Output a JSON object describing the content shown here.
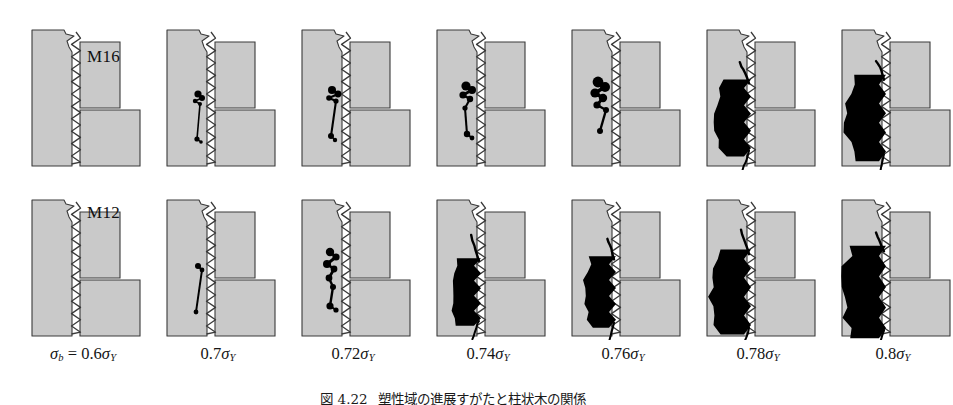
{
  "figure": {
    "caption_label": "図 4.22",
    "caption_text": "塑性域の進展すがたと柱状木の関係",
    "background_color": "#ffffff",
    "material_fill_color": "#c9c9c9",
    "outline_color": "#3a3a3a",
    "damage_color": "#000000"
  },
  "rows": [
    {
      "id": "m16",
      "label": "M16",
      "description": "Bolt-nut thread engagement cross-section, M16 size"
    },
    {
      "id": "m12",
      "label": "M12",
      "description": "Bolt-nut thread engagement cross-section, M12 size"
    }
  ],
  "stress_axis": {
    "symbol": "σ",
    "subscript_applied": "b",
    "subscript_yield": "Y",
    "labels": [
      {
        "prefix": "σ",
        "prefix_sub": "b",
        "equals": " = ",
        "value": "0.6",
        "unit_sym": "σ",
        "unit_sub": "Y"
      },
      {
        "prefix": "",
        "prefix_sub": "",
        "equals": "",
        "value": "0.7",
        "unit_sym": "σ",
        "unit_sub": "Y"
      },
      {
        "prefix": "",
        "prefix_sub": "",
        "equals": "",
        "value": "0.72",
        "unit_sym": "σ",
        "unit_sub": "Y"
      },
      {
        "prefix": "",
        "prefix_sub": "",
        "equals": "",
        "value": "0.74",
        "unit_sym": "σ",
        "unit_sub": "Y"
      },
      {
        "prefix": "",
        "prefix_sub": "",
        "equals": "",
        "value": "0.76",
        "unit_sym": "σ",
        "unit_sub": "Y"
      },
      {
        "prefix": "",
        "prefix_sub": "",
        "equals": "",
        "value": "0.78",
        "unit_sym": "σ",
        "unit_sub": "Y"
      },
      {
        "prefix": "",
        "prefix_sub": "",
        "equals": "",
        "value": "0.8",
        "unit_sym": "σ",
        "unit_sub": "Y"
      }
    ],
    "full_text": [
      "σb = 0.6σY",
      "0.7σY",
      "0.72σY",
      "0.74σY",
      "0.76σY",
      "0.78σY",
      "0.8σY"
    ]
  },
  "chart_data": {
    "type": "heatmap",
    "title": "塑性域の進展すがたと柱状木の関係",
    "xlabel": "σb",
    "ylabel": "bolt size",
    "categories": [
      "0.6σY",
      "0.7σY",
      "0.72σY",
      "0.74σY",
      "0.76σY",
      "0.78σY",
      "0.8σY"
    ],
    "series": [
      {
        "name": "M16",
        "values": [
          0,
          0.08,
          0.14,
          0.2,
          0.32,
          0.72,
          0.82
        ]
      },
      {
        "name": "M12",
        "values": [
          0,
          0.05,
          0.22,
          0.55,
          0.6,
          0.8,
          0.88
        ]
      }
    ],
    "value_meaning": "normalized extent of black plastic (damage) zone spreading from the thread root into the bolt shank",
    "grid": false,
    "legend": "none"
  },
  "panels": [
    {
      "row": "m16",
      "col": 0,
      "stress": "0.6σY",
      "damage": "none",
      "blobs": []
    },
    {
      "row": "m16",
      "col": 1,
      "stress": "0.7σY",
      "damage": "initiation",
      "blobs": [
        {
          "cx": 39,
          "cy": 76,
          "r": 3.6
        },
        {
          "cx": 43,
          "cy": 80,
          "r": 3.0
        },
        {
          "cx": 36,
          "cy": 83,
          "r": 2.2
        },
        {
          "cx": 41,
          "cy": 86,
          "r": 2.0
        },
        {
          "cx": 38,
          "cy": 121,
          "r": 2.6
        },
        {
          "cx": 42,
          "cy": 124,
          "r": 1.8
        }
      ]
    },
    {
      "row": "m16",
      "col": 2,
      "stress": "0.72σY",
      "damage": "initiation",
      "blobs": [
        {
          "cx": 38,
          "cy": 72,
          "r": 4.0
        },
        {
          "cx": 44,
          "cy": 76,
          "r": 3.4
        },
        {
          "cx": 35,
          "cy": 80,
          "r": 2.8
        },
        {
          "cx": 42,
          "cy": 83,
          "r": 2.6
        },
        {
          "cx": 37,
          "cy": 118,
          "r": 3.0
        },
        {
          "cx": 41,
          "cy": 122,
          "r": 2.2
        }
      ]
    },
    {
      "row": "m16",
      "col": 3,
      "stress": "0.74σY",
      "damage": "growing",
      "blobs": [
        {
          "cx": 37,
          "cy": 68,
          "r": 4.6
        },
        {
          "cx": 43,
          "cy": 72,
          "r": 4.0
        },
        {
          "cx": 34,
          "cy": 77,
          "r": 3.6
        },
        {
          "cx": 41,
          "cy": 81,
          "r": 3.2
        },
        {
          "cx": 36,
          "cy": 90,
          "r": 2.6
        },
        {
          "cx": 38,
          "cy": 116,
          "r": 3.2
        },
        {
          "cx": 43,
          "cy": 120,
          "r": 2.4
        }
      ]
    },
    {
      "row": "m16",
      "col": 4,
      "stress": "0.76σY",
      "damage": "coalescing",
      "blobs": [
        {
          "cx": 34,
          "cy": 64,
          "r": 5.4
        },
        {
          "cx": 41,
          "cy": 69,
          "r": 5.0
        },
        {
          "cx": 31,
          "cy": 75,
          "r": 4.6
        },
        {
          "cx": 39,
          "cy": 80,
          "r": 4.2
        },
        {
          "cx": 33,
          "cy": 87,
          "r": 3.6
        },
        {
          "cx": 42,
          "cy": 92,
          "r": 3.0
        },
        {
          "cx": 36,
          "cy": 113,
          "r": 3.0
        }
      ]
    },
    {
      "row": "m16",
      "col": 5,
      "stress": "0.78σY",
      "damage": "large-zone",
      "blobs": []
    },
    {
      "row": "m16",
      "col": 6,
      "stress": "0.8σY",
      "damage": "large-zone",
      "blobs": []
    },
    {
      "row": "m12",
      "col": 0,
      "stress": "0.6σY",
      "damage": "none",
      "blobs": []
    },
    {
      "row": "m12",
      "col": 1,
      "stress": "0.7σY",
      "damage": "initiation",
      "blobs": [
        {
          "cx": 39,
          "cy": 78,
          "r": 3.0
        },
        {
          "cx": 43,
          "cy": 82,
          "r": 2.4
        },
        {
          "cx": 37,
          "cy": 124,
          "r": 2.4
        }
      ]
    },
    {
      "row": "m12",
      "col": 2,
      "stress": "0.72σY",
      "damage": "growing",
      "blobs": [
        {
          "cx": 36,
          "cy": 64,
          "r": 4.2
        },
        {
          "cx": 42,
          "cy": 69,
          "r": 3.6
        },
        {
          "cx": 33,
          "cy": 76,
          "r": 4.0
        },
        {
          "cx": 40,
          "cy": 81,
          "r": 3.4
        },
        {
          "cx": 35,
          "cy": 90,
          "r": 3.4
        },
        {
          "cx": 39,
          "cy": 99,
          "r": 3.0
        },
        {
          "cx": 36,
          "cy": 118,
          "r": 3.6
        },
        {
          "cx": 42,
          "cy": 122,
          "r": 2.6
        }
      ]
    },
    {
      "row": "m12",
      "col": 3,
      "stress": "0.74σY",
      "damage": "large-zone",
      "blobs": []
    },
    {
      "row": "m12",
      "col": 4,
      "stress": "0.76σY",
      "damage": "large-zone",
      "blobs": []
    },
    {
      "row": "m12",
      "col": 5,
      "stress": "0.78σY",
      "damage": "large-zone",
      "blobs": []
    },
    {
      "row": "m12",
      "col": 6,
      "stress": "0.8σY",
      "damage": "large-zone",
      "blobs": []
    }
  ]
}
